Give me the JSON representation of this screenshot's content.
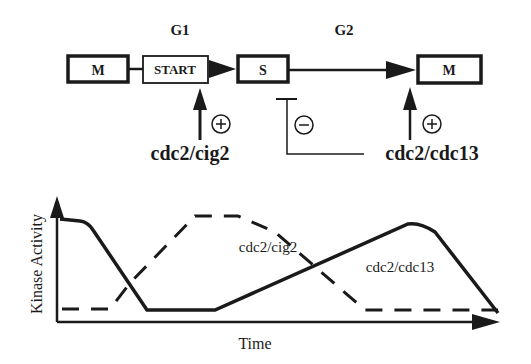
{
  "schematic": {
    "phases": {
      "g1": "G1",
      "g2": "G2"
    },
    "boxes": {
      "m_left": "M",
      "start": "START",
      "s": "S",
      "m_right": "M"
    },
    "regulators": {
      "cig2": {
        "label": "cdc2/cig2",
        "sign": "+"
      },
      "cdc13_inhibit": {
        "sign": "−"
      },
      "cdc13_activate": {
        "label": "cdc2/cdc13",
        "sign": "+"
      }
    }
  },
  "graph": {
    "ylabel": "Kinase Activity",
    "xlabel": "Time",
    "series": [
      {
        "name": "cdc2/cig2",
        "style": "dashed"
      },
      {
        "name": "cdc2/cdc13",
        "style": "solid"
      }
    ]
  },
  "colors": {
    "ink": "#1a1a1a",
    "background": "#ffffff"
  }
}
